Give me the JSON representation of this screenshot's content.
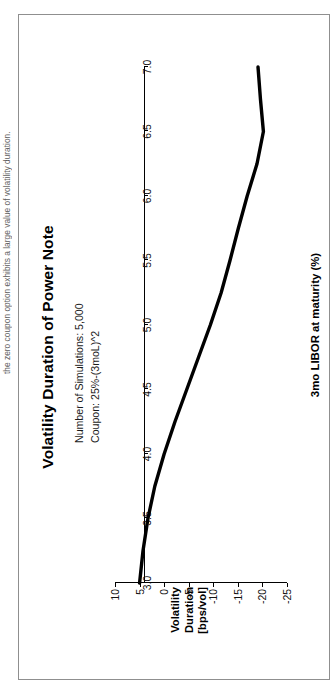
{
  "caption": {
    "text": "the zero coupon option exhibits a large value of volatility duration."
  },
  "figure": {
    "title": "Volatility Duration of Power Note"
  },
  "annotation": {
    "lines": [
      "Number of Simulations: 5,000",
      "Coupon: 25%-(3moL)^2"
    ]
  },
  "axis_titles": {
    "x": "3mo LIBOR at maturity (%)",
    "y_line1": "Volatility",
    "y_line2": "Duration",
    "y_line3": "[bps/vol]"
  },
  "colors": {
    "curve": "#000000",
    "axis": "#000000",
    "frame": "#8f8f8f",
    "background": "#ffffff"
  },
  "chart_data": {
    "type": "line",
    "title": "Volatility Duration of Power Note",
    "xlabel": "3mo LIBOR at maturity (%)",
    "ylabel": "Volatility Duration [bps/vol]",
    "xlim": [
      3.0,
      7.0
    ],
    "ylim": [
      -25,
      10
    ],
    "xticks": [
      "3.0",
      "3.5",
      "4.0",
      "4.5",
      "5.0",
      "5.5",
      "6.0",
      "6.5",
      "7.0"
    ],
    "xtick_values": [
      3.0,
      3.5,
      4.0,
      4.5,
      5.0,
      5.5,
      6.0,
      6.5,
      7.0
    ],
    "yticks": [
      "10",
      "5",
      "0",
      "-5",
      "-10",
      "-15",
      "-20",
      "-25"
    ],
    "ytick_values": [
      10,
      5,
      0,
      -5,
      -10,
      -15,
      -20,
      -25
    ],
    "grid": false,
    "legend": null,
    "annotations": [
      "Number of Simulations: 5,000",
      "Coupon: 25%-(3moL)^2"
    ],
    "series": [
      {
        "name": "Volatility Duration",
        "x": [
          3.0,
          3.25,
          3.5,
          3.75,
          4.0,
          4.25,
          4.5,
          4.75,
          5.0,
          5.25,
          5.5,
          5.75,
          6.0,
          6.25,
          6.5,
          6.75,
          7.0
        ],
        "values": [
          5.0,
          4.3,
          3.3,
          1.9,
          0.0,
          -2.2,
          -4.6,
          -7.0,
          -9.4,
          -11.6,
          -13.4,
          -15.1,
          -16.9,
          -18.9,
          -20.2,
          -19.6,
          -19.1
        ]
      }
    ]
  }
}
